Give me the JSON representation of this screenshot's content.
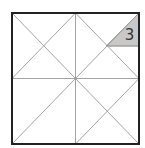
{
  "diagram": {
    "frame": {
      "x": 12,
      "y": 13,
      "width": 127,
      "height": 131,
      "stroke": "#222222",
      "stroke_width": 2
    },
    "line_color": "#9a9a9a",
    "shaded_region": {
      "fill": "#c8c8c8",
      "label": "3",
      "label_color": "#333333"
    }
  }
}
